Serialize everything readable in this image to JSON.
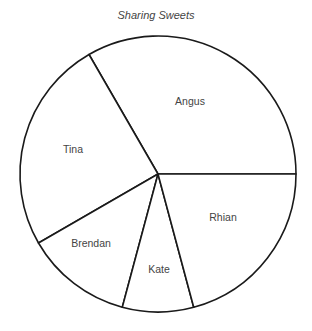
{
  "chart_data": {
    "type": "pie",
    "title": "Sharing Sweets",
    "categories": [
      "Angus",
      "Tina",
      "Brendan",
      "Kate",
      "Rhian"
    ],
    "values": [
      120,
      90,
      45,
      30,
      75
    ],
    "units": "degrees",
    "fractions": [
      "1/3",
      "1/4",
      "1/8",
      "1/12",
      "5/24"
    ],
    "start_angle_deg": 0,
    "direction": "counterclockwise",
    "legend": "none (labels inside slices)",
    "colors": {
      "fill": "#ffffff",
      "stroke": "#1a1a1a",
      "label": "#444444"
    }
  },
  "geometry": {
    "cx": 158,
    "cy": 174,
    "r": 138
  },
  "labels": [
    {
      "name": "Angus",
      "x": 190,
      "y": 102
    },
    {
      "name": "Tina",
      "x": 73,
      "y": 150
    },
    {
      "name": "Brendan",
      "x": 91,
      "y": 244
    },
    {
      "name": "Kate",
      "x": 159,
      "y": 270
    },
    {
      "name": "Rhian",
      "x": 223,
      "y": 218
    }
  ]
}
